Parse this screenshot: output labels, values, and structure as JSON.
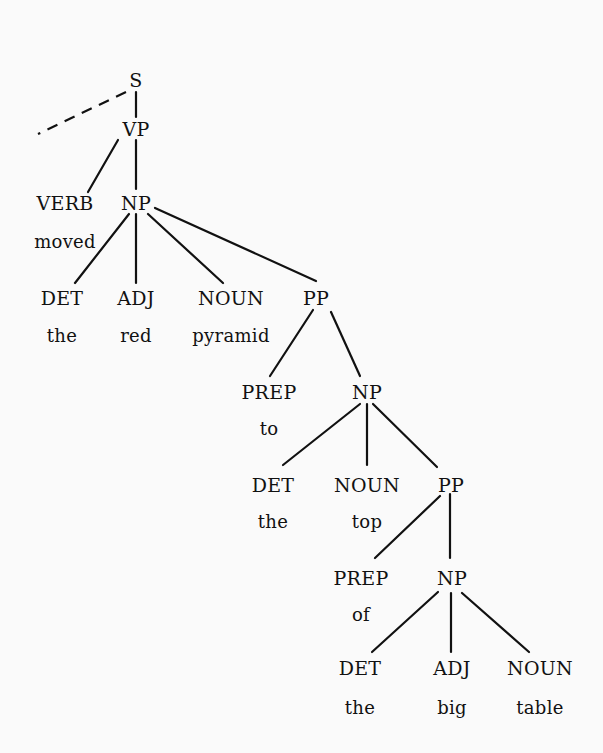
{
  "diagram": {
    "type": "parse-tree",
    "nodes": [
      {
        "id": "S",
        "label": "S",
        "x": 136,
        "y": 80
      },
      {
        "id": "VP",
        "label": "VP",
        "x": 136,
        "y": 129
      },
      {
        "id": "VERB",
        "label": "VERB",
        "x": 65,
        "y": 203,
        "word": "moved",
        "wy": 241
      },
      {
        "id": "NP1",
        "label": "NP",
        "x": 136,
        "y": 203
      },
      {
        "id": "DET1",
        "label": "DET",
        "x": 62,
        "y": 298,
        "word": "the",
        "wy": 335
      },
      {
        "id": "ADJ1",
        "label": "ADJ",
        "x": 136,
        "y": 298,
        "word": "red",
        "wy": 335
      },
      {
        "id": "NOUN1",
        "label": "NOUN",
        "x": 231,
        "y": 298,
        "word": "pyramid",
        "wy": 335
      },
      {
        "id": "PP1",
        "label": "PP",
        "x": 316,
        "y": 298
      },
      {
        "id": "PREP1",
        "label": "PREP",
        "x": 269,
        "y": 392,
        "word": "to",
        "wy": 428
      },
      {
        "id": "NP2",
        "label": "NP",
        "x": 367,
        "y": 392
      },
      {
        "id": "DET2",
        "label": "DET",
        "x": 273,
        "y": 485,
        "word": "the",
        "wy": 521
      },
      {
        "id": "NOUN2",
        "label": "NOUN",
        "x": 367,
        "y": 485,
        "word": "top",
        "wy": 521
      },
      {
        "id": "PP2",
        "label": "PP",
        "x": 451,
        "y": 485
      },
      {
        "id": "PREP2",
        "label": "PREP",
        "x": 361,
        "y": 578,
        "word": "of",
        "wy": 614
      },
      {
        "id": "NP3",
        "label": "NP",
        "x": 452,
        "y": 578
      },
      {
        "id": "DET3",
        "label": "DET",
        "x": 360,
        "y": 668,
        "word": "the",
        "wy": 707
      },
      {
        "id": "ADJ3",
        "label": "ADJ",
        "x": 452,
        "y": 668,
        "word": "big",
        "wy": 707
      },
      {
        "id": "NOUN3",
        "label": "NOUN",
        "x": 540,
        "y": 668,
        "word": "table",
        "wy": 707
      }
    ],
    "edges": [
      {
        "from": "S",
        "to": "VP",
        "x1": 136,
        "y1": 92,
        "x2": 136,
        "y2": 117
      },
      {
        "from": "S",
        "to": "(elided)",
        "style": "dashed",
        "x1": 126,
        "y1": 92,
        "x2": 38,
        "y2": 134
      },
      {
        "from": "VP",
        "to": "VERB",
        "x1": 118,
        "y1": 140,
        "x2": 88,
        "y2": 192
      },
      {
        "from": "VP",
        "to": "NP1",
        "x1": 136,
        "y1": 140,
        "x2": 136,
        "y2": 189
      },
      {
        "from": "NP1",
        "to": "DET1",
        "x1": 129,
        "y1": 214,
        "x2": 75,
        "y2": 283
      },
      {
        "from": "NP1",
        "to": "ADJ1",
        "x1": 136,
        "y1": 214,
        "x2": 136,
        "y2": 283
      },
      {
        "from": "NP1",
        "to": "NOUN1",
        "x1": 148,
        "y1": 214,
        "x2": 223,
        "y2": 283
      },
      {
        "from": "NP1",
        "to": "PP1",
        "x1": 155,
        "y1": 208,
        "x2": 316,
        "y2": 281
      },
      {
        "from": "PP1",
        "to": "PREP1",
        "x1": 313,
        "y1": 310,
        "x2": 270,
        "y2": 376
      },
      {
        "from": "PP1",
        "to": "NP2",
        "x1": 331,
        "y1": 312,
        "x2": 360,
        "y2": 376
      },
      {
        "from": "NP2",
        "to": "DET2",
        "x1": 360,
        "y1": 404,
        "x2": 283,
        "y2": 465
      },
      {
        "from": "NP2",
        "to": "NOUN2",
        "x1": 367,
        "y1": 404,
        "x2": 367,
        "y2": 465
      },
      {
        "from": "NP2",
        "to": "PP2",
        "x1": 373,
        "y1": 404,
        "x2": 437,
        "y2": 467
      },
      {
        "from": "PP2",
        "to": "PREP2",
        "x1": 440,
        "y1": 496,
        "x2": 375,
        "y2": 558
      },
      {
        "from": "PP2",
        "to": "NP3",
        "x1": 450,
        "y1": 494,
        "x2": 450,
        "y2": 558
      },
      {
        "from": "NP3",
        "to": "DET3",
        "x1": 438,
        "y1": 592,
        "x2": 372,
        "y2": 652
      },
      {
        "from": "NP3",
        "to": "ADJ3",
        "x1": 451,
        "y1": 593,
        "x2": 451,
        "y2": 652
      },
      {
        "from": "NP3",
        "to": "NOUN3",
        "x1": 462,
        "y1": 593,
        "x2": 529,
        "y2": 652
      }
    ]
  },
  "labels": {
    "S": "S",
    "VP": "VP",
    "VERB": "VERB",
    "VERB_word": "moved",
    "NP1": "NP",
    "DET1": "DET",
    "DET1_word": "the",
    "ADJ1": "ADJ",
    "ADJ1_word": "red",
    "NOUN1": "NOUN",
    "NOUN1_word": "pyramid",
    "PP1": "PP",
    "PREP1": "PREP",
    "PREP1_word": "to",
    "NP2": "NP",
    "DET2": "DET",
    "DET2_word": "the",
    "NOUN2": "NOUN",
    "NOUN2_word": "top",
    "PP2": "PP",
    "PREP2": "PREP",
    "PREP2_word": "of",
    "NP3": "NP",
    "DET3": "DET",
    "DET3_word": "the",
    "ADJ3": "ADJ",
    "ADJ3_word": "big",
    "NOUN3": "NOUN",
    "NOUN3_word": "table"
  },
  "colors": {
    "background": "#fafafa",
    "ink": "#111111"
  }
}
